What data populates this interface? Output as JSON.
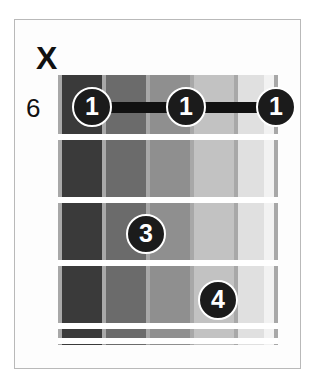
{
  "diagram": {
    "type": "guitar-chord-diagram",
    "instrument": "guitar",
    "string_count": 6,
    "fret_count": 5,
    "starting_fret_label": "6",
    "mute_marker_label": "X",
    "colors": {
      "background": "#ffffff",
      "border": "#b9b9b9",
      "fret_line": "#ffffff",
      "string_line": "#a8a8a8",
      "marker_fill": "#1b1b1b",
      "marker_text": "#ffffff",
      "barre": "#111111",
      "label_text": "#111111"
    },
    "board_bands": [
      {
        "name": "band-string-6",
        "left": 0,
        "width": 44,
        "color": "#3a3a3a"
      },
      {
        "name": "band-string-5",
        "left": 44,
        "width": 44,
        "color": "#6b6b6b"
      },
      {
        "name": "band-string-4",
        "left": 88,
        "width": 44,
        "color": "#8f8f8f"
      },
      {
        "name": "band-string-3",
        "left": 132,
        "width": 44,
        "color": "#c2c2c2"
      },
      {
        "name": "band-string-2",
        "left": 176,
        "width": 30,
        "color": "#e0e0e0"
      },
      {
        "name": "band-string-1",
        "left": 206,
        "width": 14,
        "color": "#f2f2f2"
      }
    ],
    "strings": [
      {
        "number": 6,
        "name": "string-6",
        "x": 0,
        "status": "muted"
      },
      {
        "number": 5,
        "name": "string-5",
        "x": 44,
        "status": "fretted"
      },
      {
        "number": 4,
        "name": "string-4",
        "x": 88,
        "status": "fretted"
      },
      {
        "number": 3,
        "name": "string-3",
        "x": 132,
        "status": "fretted"
      },
      {
        "number": 2,
        "name": "string-2",
        "x": 176,
        "status": "fretted"
      },
      {
        "number": 1,
        "name": "string-1",
        "x": 216,
        "status": "fretted"
      }
    ],
    "fret_lines": [
      {
        "name": "fret-line-1",
        "y": 59
      },
      {
        "name": "fret-line-2",
        "y": 122
      },
      {
        "name": "fret-line-3",
        "y": 185
      },
      {
        "name": "fret-line-4",
        "y": 248
      },
      {
        "name": "fret-line-5",
        "y": 263
      }
    ],
    "barres": [
      {
        "name": "barre-fret-1",
        "finger": "1",
        "fret": 1,
        "from_string": 5,
        "to_string": 1,
        "left": 34,
        "top": 27,
        "width": 184
      }
    ],
    "finger_markers": [
      {
        "name": "finger-marker-1a",
        "label": "1",
        "string": 5,
        "fret": 1,
        "x": 34,
        "y": 32
      },
      {
        "name": "finger-marker-1b",
        "label": "1",
        "string": 3,
        "fret": 1,
        "x": 128,
        "y": 32
      },
      {
        "name": "finger-marker-1c",
        "label": "1",
        "string": 1,
        "fret": 1,
        "x": 218,
        "y": 32
      },
      {
        "name": "finger-marker-3",
        "label": "3",
        "string": 3,
        "fret": 3,
        "x": 88,
        "y": 159
      },
      {
        "name": "finger-marker-4",
        "label": "4",
        "string": 2,
        "fret": 4,
        "x": 160,
        "y": 225
      }
    ]
  }
}
